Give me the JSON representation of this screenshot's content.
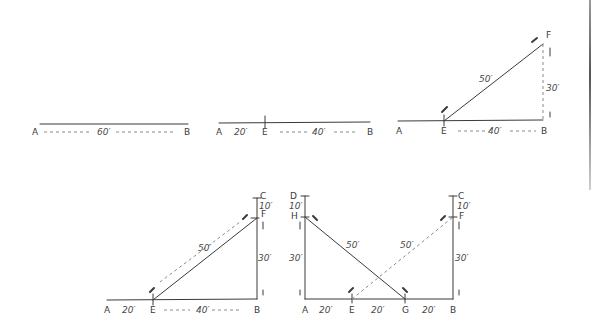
{
  "figures": [
    {
      "id": "fig1",
      "points": {
        "A": "A",
        "B": "B"
      },
      "dims": {
        "AB": "60′"
      }
    },
    {
      "id": "fig2",
      "points": {
        "A": "A",
        "E": "E",
        "B": "B"
      },
      "dims": {
        "AE": "20′",
        "EB": "40′"
      }
    },
    {
      "id": "fig3",
      "points": {
        "A": "A",
        "E": "E",
        "B": "B",
        "F": "F"
      },
      "dims": {
        "EB": "40′",
        "EF": "50′",
        "BF": "30′"
      }
    },
    {
      "id": "fig4",
      "points": {
        "A": "A",
        "E": "E",
        "B": "B",
        "F": "F",
        "C": "C"
      },
      "dims": {
        "AE": "20′",
        "EB": "40′",
        "EF": "50′",
        "BF": "30′",
        "FC": "10′"
      }
    },
    {
      "id": "fig5",
      "points": {
        "A": "A",
        "E": "E",
        "G": "G",
        "B": "B",
        "F": "F",
        "C": "C",
        "H": "H",
        "D": "D"
      },
      "dims": {
        "AE": "20′",
        "EG": "20′",
        "GB": "20′",
        "EF": "50′",
        "GH": "50′",
        "BF": "30′",
        "AH": "30′",
        "FC": "10′",
        "HD": "10′"
      }
    }
  ]
}
